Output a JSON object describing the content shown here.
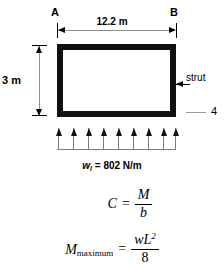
{
  "diagram": {
    "type": "simply-supported-beam-uniform-load",
    "span": {
      "label_left": "A",
      "label_right": "B",
      "dimension_text": "12.2 m",
      "value": 12.2,
      "unit": "m"
    },
    "depth": {
      "dimension_text": "3 m",
      "value": 3,
      "unit": "m"
    },
    "callouts": [
      {
        "text": "strut",
        "name": "strut-callout"
      },
      {
        "text": "4",
        "name": "note-4-callout"
      }
    ],
    "load": {
      "symbol": "w",
      "subscript": "l",
      "equals": "=",
      "magnitude": "802",
      "unit": "N/m",
      "full_text": "w_l = 802 N/m",
      "arrow_count": 9,
      "direction": "up"
    }
  },
  "equations": [
    {
      "name": "compression-force",
      "lhs": "C",
      "operator": "=",
      "numerator": "M",
      "denominator": "b"
    },
    {
      "name": "maximum-moment",
      "lhs": "M",
      "lhs_subscript": "maximum",
      "operator": "=",
      "numerator_var": "wL",
      "numerator_exponent": "2",
      "denominator": "8"
    }
  ],
  "colors": {
    "beam_stroke": "#111111",
    "dimension_line": "#8d8d8d",
    "load_stem": "#7c7c7c",
    "background": "#ffffff",
    "text": "#000000"
  }
}
